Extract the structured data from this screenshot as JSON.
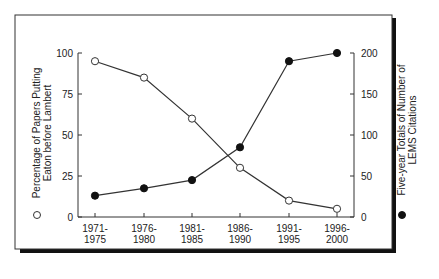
{
  "chart_data": {
    "type": "line",
    "title": "",
    "categories": [
      "1971-\n1975",
      "1976-\n1980",
      "1981-\n1985",
      "1986-\n1990",
      "1991-\n1995",
      "1996-\n2000"
    ],
    "category_lines": [
      [
        "1971-",
        "1975"
      ],
      [
        "1976-",
        "1980"
      ],
      [
        "1981-",
        "1985"
      ],
      [
        "1986-",
        "1990"
      ],
      [
        "1991-",
        "1995"
      ],
      [
        "1996-",
        "2000"
      ]
    ],
    "series": [
      {
        "name": "Percentage of Papers Putting Eaton before Lambert",
        "axis": "left",
        "marker": "open-circle",
        "values": [
          95,
          85,
          60,
          30,
          10,
          5
        ]
      },
      {
        "name": "Five-year Totals of Number of LEMS Citations",
        "axis": "right",
        "marker": "filled-circle",
        "values": [
          26,
          35,
          45,
          85,
          190,
          200
        ]
      }
    ],
    "left_axis": {
      "label_lines": [
        "Percentage of Papers Putting",
        "Eaton before Lambert"
      ],
      "legend_marker": "○",
      "ticks": [
        0,
        25,
        50,
        75,
        100
      ],
      "ylim": [
        0,
        100
      ]
    },
    "right_axis": {
      "label_lines": [
        "Five-year Totals of Number of",
        "LEMS Citations"
      ],
      "legend_marker": "●",
      "ticks": [
        0,
        50,
        100,
        150,
        200
      ],
      "ylim": [
        0,
        200
      ]
    },
    "xlabel": "",
    "grid": false,
    "legend_position": "axis labels"
  },
  "tick_text": {
    "left": [
      "0",
      "25",
      "50",
      "75",
      "100"
    ],
    "right": [
      "0",
      "50",
      "100",
      "150",
      "200"
    ]
  }
}
